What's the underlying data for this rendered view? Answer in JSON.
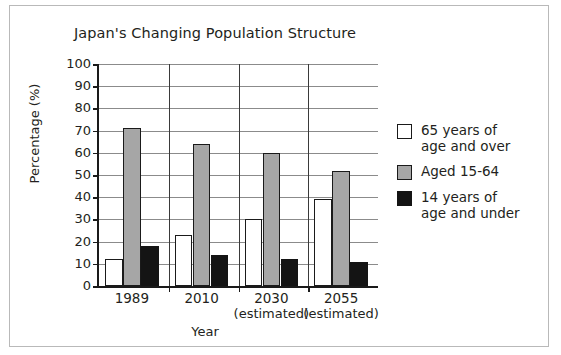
{
  "figure": {
    "border_color": "#b9b9b9"
  },
  "chart_data": {
    "type": "bar",
    "title": "Japan's Changing Population Structure",
    "xlabel": "Year",
    "ylabel": "Percentage (%)",
    "ylim": [
      0,
      100
    ],
    "ytick_step": 10,
    "grid": true,
    "legend_position": "right",
    "categories": [
      "1989",
      "2010",
      "2030",
      "2055"
    ],
    "category_sublabels": [
      "",
      "",
      "(estimated)",
      "(estimated)"
    ],
    "ytick_labels": [
      "100",
      "90",
      "80",
      "70",
      "60",
      "50",
      "40",
      "30",
      "20",
      "10",
      "0"
    ],
    "series": [
      {
        "name": "65 years of age and over",
        "legend_line1": "65 years of",
        "legend_line2": "age and over",
        "color": "#ffffff",
        "values": [
          12,
          23,
          30,
          39
        ]
      },
      {
        "name": "Aged 15-64",
        "legend_line1": "Aged 15-64",
        "legend_line2": "",
        "color": "#a6a6a6",
        "values": [
          71,
          64,
          60,
          52
        ]
      },
      {
        "name": "14 years of age and under",
        "legend_line1": "14 years of",
        "legend_line2": "age and under",
        "color": "#141414",
        "values": [
          18,
          14,
          12,
          11
        ]
      }
    ]
  }
}
